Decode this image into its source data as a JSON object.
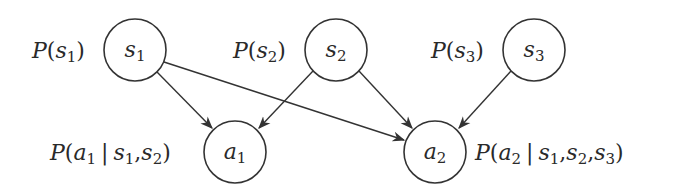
{
  "diagram": {
    "type": "bayesian-network",
    "colors": {
      "stroke": "#333333",
      "text": "#2a2a2a",
      "background": "#ffffff"
    },
    "nodes": [
      {
        "id": "s1",
        "var": "s",
        "sub": "1",
        "cx": 135,
        "cy": 50,
        "r": 31,
        "prob": {
          "text": "P(s1)",
          "parts": [
            "P",
            "(",
            "s",
            "1",
            ")"
          ]
        }
      },
      {
        "id": "s2",
        "var": "s",
        "sub": "2",
        "cx": 336,
        "cy": 50,
        "r": 31,
        "prob": {
          "text": "P(s2)",
          "parts": [
            "P",
            "(",
            "s",
            "2",
            ")"
          ]
        }
      },
      {
        "id": "s3",
        "var": "s",
        "sub": "3",
        "cx": 534,
        "cy": 50,
        "r": 31,
        "prob": {
          "text": "P(s3)",
          "parts": [
            "P",
            "(",
            "s",
            "3",
            ")"
          ]
        }
      },
      {
        "id": "a1",
        "var": "a",
        "sub": "1",
        "cx": 235,
        "cy": 152,
        "r": 31,
        "prob": {
          "text": "P(a1 | s1,s2)"
        }
      },
      {
        "id": "a2",
        "var": "a",
        "sub": "2",
        "cx": 435,
        "cy": 152,
        "r": 31,
        "prob": {
          "text": "P(a2 | s1,s2,s3)"
        }
      }
    ],
    "edges": [
      {
        "from": "s1",
        "to": "a1"
      },
      {
        "from": "s1",
        "to": "a2"
      },
      {
        "from": "s2",
        "to": "a1"
      },
      {
        "from": "s2",
        "to": "a2"
      },
      {
        "from": "s3",
        "to": "a2"
      }
    ],
    "sym": {
      "P": "P",
      "open": "(",
      "close": ")",
      "bar": "|",
      "comma": ",",
      "s": "s",
      "a": "a",
      "one": "1",
      "two": "2",
      "three": "3"
    }
  }
}
